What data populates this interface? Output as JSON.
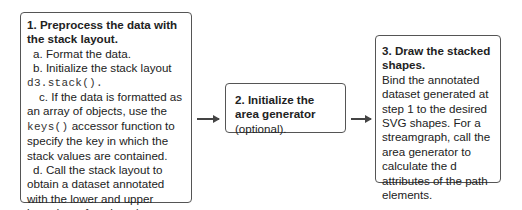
{
  "step1": {
    "title": "1. Preprocess the data with the stack layout.",
    "a": "a. Format the data.",
    "b_text": "b. Initialize the stack layout",
    "b_code": "d3.stack().",
    "c_pre": "c. If the data is formatted as an array of objects, use the ",
    "c_code": "keys()",
    "c_post": " accessor function to specify the key in which the stack values are contained.",
    "d": "d. Call the stack layout to obtain a dataset annotated with the lower and upper boundary of each series."
  },
  "step2": {
    "title": "2. Initialize the area generator",
    "note": " (optional)."
  },
  "step3": {
    "title": "3. Draw the stacked shapes.",
    "body": "Bind the annotated dataset generated at step 1 to the desired SVG shapes. For a streamgraph, call the area generator to calculate the d attributes of the path elements."
  },
  "connectors": [
    {
      "from": "step1",
      "to": "step2"
    },
    {
      "from": "step2",
      "to": "step3"
    }
  ]
}
